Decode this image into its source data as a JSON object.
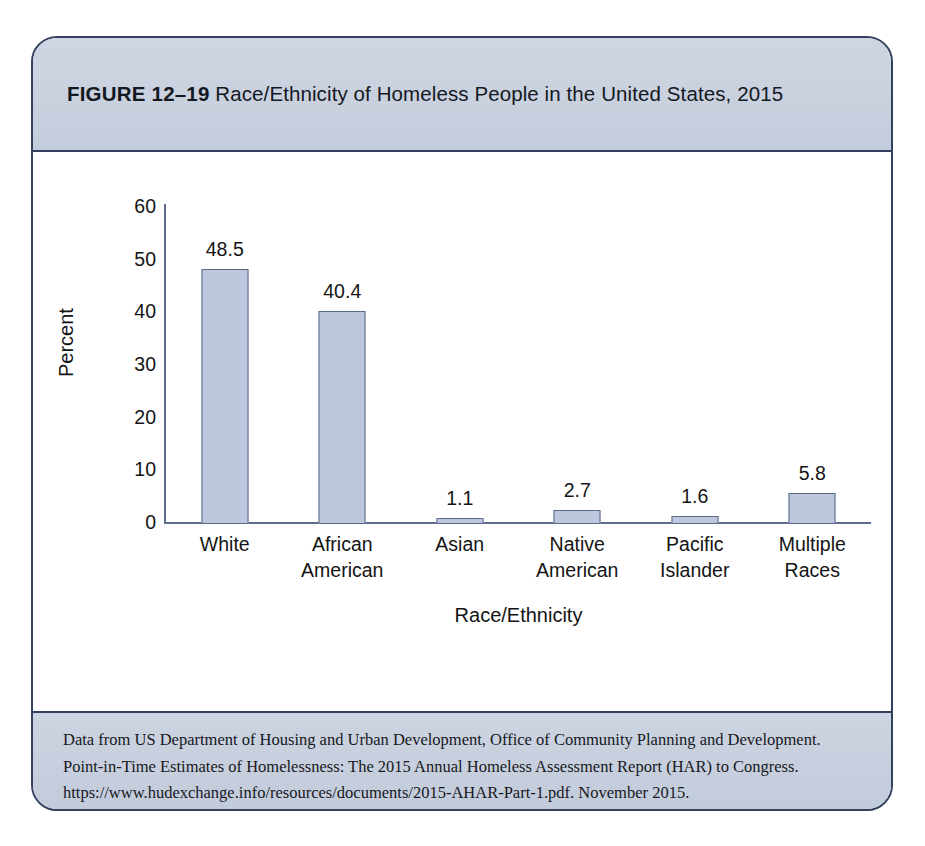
{
  "figure": {
    "number_label": "FIGURE 12–19",
    "title_text": "Race/Ethnicity of Homeless People in the United States, 2015",
    "border_color": "#33415e",
    "band_color": "#c9d1df"
  },
  "footer": {
    "lines": [
      "Data from US Department of Housing and Urban Development, Office of Community Planning and Development.",
      "Point-in-Time Estimates of Homelessness: The 2015 Annual Homeless Assessment Report (HAR) to Congress.",
      "https://www.hudexchange.info/resources/documents/2015-AHAR-Part-1.pdf. November 2015."
    ]
  },
  "chart_data": {
    "type": "bar",
    "title": "Race/Ethnicity of Homeless People in the United States, 2015",
    "xlabel": "Race/Ethnicity",
    "ylabel": "Percent",
    "categories": [
      "White",
      "African American",
      "Asian",
      "Native American",
      "Pacific Islander",
      "Multiple Races"
    ],
    "category_lines": [
      [
        "White"
      ],
      [
        "African",
        "American"
      ],
      [
        "Asian"
      ],
      [
        "Native",
        "American"
      ],
      [
        "Pacific",
        "Islander"
      ],
      [
        "Multiple",
        "Races"
      ]
    ],
    "values": [
      48.5,
      40.4,
      1.1,
      2.7,
      1.6,
      5.8
    ],
    "value_labels": [
      "48.5",
      "40.4",
      "1.1",
      "2.7",
      "1.6",
      "5.8"
    ],
    "ylim": [
      0,
      60
    ],
    "yticks": [
      0,
      10,
      20,
      30,
      40,
      50,
      60
    ],
    "ytick_labels": [
      "0",
      "10",
      "20",
      "30",
      "40",
      "50",
      "60"
    ],
    "grid": false,
    "legend": false,
    "bar_fill": "#bcc6dd",
    "bar_edge": "#586888",
    "axis_color": "#5d6b8d"
  }
}
